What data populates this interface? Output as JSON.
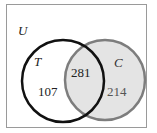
{
  "diagram": {
    "type": "venn",
    "universe_label": "U",
    "sets": [
      {
        "name": "T",
        "only_count": "107",
        "color": "#111111",
        "fill": "none"
      },
      {
        "name": "C",
        "only_count": "214",
        "color": "#7a7a7a",
        "fill": "#e6e6e6"
      }
    ],
    "intersection_count": "281"
  }
}
